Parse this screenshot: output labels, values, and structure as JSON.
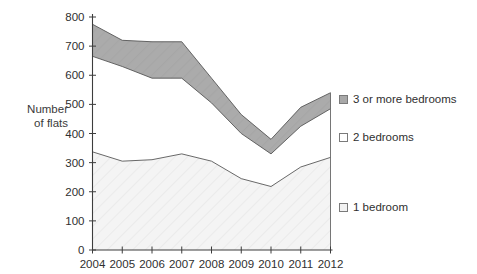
{
  "chart": {
    "title": "",
    "y_axis_title_line1": "Number",
    "y_axis_title_line2": "of flats"
  },
  "legend": {
    "position": "right",
    "items": [
      {
        "label": "3 or more bedrooms",
        "color": "#a8a8a8",
        "border": "#7a7a7a",
        "key": "three_plus"
      },
      {
        "label": "2 bedrooms",
        "color": "#ffffff",
        "border": "#7a7a7a",
        "key": "two"
      },
      {
        "label": "1 bedroom",
        "color": "#f2f2f2",
        "border": "#7a7a7a",
        "key": "one"
      }
    ]
  },
  "chart_data": {
    "type": "area",
    "stacked": true,
    "title": "",
    "xlabel": "",
    "ylabel": "Number of flats",
    "grid": false,
    "legend_position": "right",
    "x": [
      2004,
      2005,
      2006,
      2007,
      2008,
      2009,
      2010,
      2011,
      2012
    ],
    "categories": [
      "2004",
      "2005",
      "2006",
      "2007",
      "2008",
      "2009",
      "2010",
      "2011",
      "2012"
    ],
    "xlim": [
      2004,
      2012
    ],
    "ylim": [
      0,
      800
    ],
    "y_ticks": [
      0,
      100,
      200,
      300,
      400,
      500,
      600,
      700,
      800
    ],
    "y_tick_labels": [
      "0",
      "100",
      "200",
      "300",
      "400",
      "500",
      "600",
      "700",
      "800"
    ],
    "series": [
      {
        "name": "1 bedroom",
        "color": "#f2f2f2",
        "values": [
          337,
          305,
          310,
          330,
          305,
          245,
          218,
          285,
          318
        ],
        "cumulative_top": [
          337,
          305,
          310,
          330,
          305,
          245,
          218,
          285,
          318
        ]
      },
      {
        "name": "2 bedrooms",
        "color": "#ffffff",
        "values": [
          328,
          325,
          280,
          260,
          200,
          155,
          112,
          140,
          167
        ],
        "cumulative_top": [
          665,
          630,
          590,
          590,
          505,
          400,
          330,
          425,
          485
        ]
      },
      {
        "name": "3 or more bedrooms",
        "color": "#a8a8a8",
        "values": [
          110,
          90,
          125,
          125,
          85,
          65,
          50,
          65,
          55
        ],
        "cumulative_top": [
          775,
          720,
          715,
          715,
          590,
          465,
          380,
          490,
          540
        ]
      }
    ]
  }
}
